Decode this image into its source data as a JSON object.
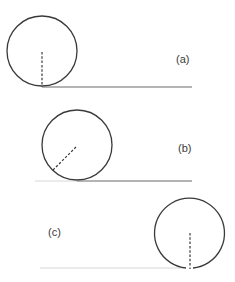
{
  "diagram": {
    "colors": {
      "stroke": "#3a3a3a",
      "faint_line": "#d8d8d8",
      "background": "#ffffff"
    },
    "panels": [
      {
        "id": "a",
        "label": "(a)",
        "circle": {
          "cx": 42,
          "cy": 51,
          "r": 35
        },
        "radius_marker": {
          "x1": 42,
          "y1": 52,
          "x2": 42,
          "y2": 87,
          "orientation": "vertical-down"
        },
        "ground_line": {
          "x1": 42,
          "x2": 192,
          "y": 87,
          "style": "solid-dark"
        },
        "label_pos": {
          "x": 176,
          "y": 63
        }
      },
      {
        "id": "b",
        "label": "(b)",
        "circle": {
          "cx": 77,
          "cy": 145,
          "r": 35
        },
        "radius_marker": {
          "x1": 76,
          "y1": 147,
          "x2": 52,
          "y2": 171,
          "orientation": "diagonal-lower-left"
        },
        "ground_line": {
          "x1": 77,
          "x2": 192,
          "y": 181,
          "style": "solid-dark"
        },
        "faint_line": {
          "x1": 35,
          "x2": 77,
          "y": 181
        },
        "label_pos": {
          "x": 178,
          "y": 152
        }
      },
      {
        "id": "c",
        "label": "(c)",
        "circle": {
          "cx": 190,
          "cy": 233,
          "r": 35
        },
        "radius_marker": {
          "x1": 190,
          "y1": 233,
          "x2": 190,
          "y2": 269,
          "orientation": "vertical-down"
        },
        "faint_line": {
          "x1": 40,
          "x2": 184,
          "y": 268
        },
        "label_pos": {
          "x": 48,
          "y": 236
        }
      }
    ]
  }
}
